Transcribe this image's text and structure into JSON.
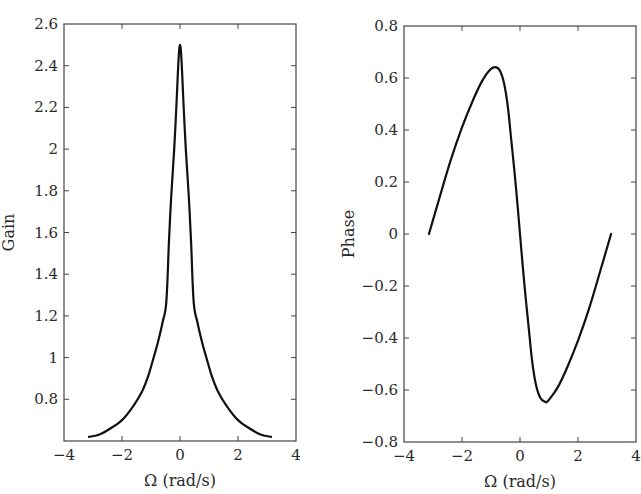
{
  "chart_data": [
    {
      "id": "gain",
      "type": "line",
      "title": "",
      "xlabel": "Ω (rad/s)",
      "ylabel": "Gain",
      "xlim": [
        -4,
        4
      ],
      "ylim": [
        0.6,
        2.6
      ],
      "xticks": [
        -4,
        -2,
        0,
        2,
        4
      ],
      "xtick_labels": [
        "−4",
        "−2",
        "0",
        "2",
        "4"
      ],
      "yticks": [
        0.8,
        1,
        1.2,
        1.4,
        1.6,
        1.8,
        2,
        2.2,
        2.4,
        2.6
      ],
      "ytick_labels": [
        "0.8",
        "1",
        "1.2",
        "1.4",
        "1.6",
        "1.8",
        "2",
        "2.2",
        "2.4",
        "2.6"
      ],
      "grid": false,
      "legend": null,
      "series": [
        {
          "name": "Gain",
          "x": [
            -3.14,
            -2.8,
            -2.4,
            -2.0,
            -1.6,
            -1.3,
            -1.1,
            -0.93,
            -0.75,
            -0.6,
            -0.47,
            -0.38,
            -0.3,
            -0.2,
            -0.12,
            -0.05,
            0,
            0.05,
            0.12,
            0.2,
            0.3,
            0.38,
            0.47,
            0.6,
            0.75,
            0.93,
            1.1,
            1.3,
            1.6,
            2.0,
            2.4,
            2.8,
            3.14
          ],
          "y": [
            0.62,
            0.63,
            0.66,
            0.7,
            0.77,
            0.84,
            0.91,
            0.99,
            1.08,
            1.17,
            1.27,
            1.56,
            1.78,
            2.0,
            2.22,
            2.43,
            2.5,
            2.43,
            2.22,
            2.0,
            1.78,
            1.56,
            1.27,
            1.17,
            1.08,
            0.99,
            0.91,
            0.84,
            0.77,
            0.7,
            0.66,
            0.63,
            0.62
          ]
        }
      ]
    },
    {
      "id": "phase",
      "type": "line",
      "title": "",
      "xlabel": "Ω (rad/s)",
      "ylabel": "Phase",
      "xlim": [
        -4,
        4
      ],
      "ylim": [
        -0.8,
        0.8
      ],
      "xticks": [
        -4,
        -2,
        0,
        2,
        4
      ],
      "xtick_labels": [
        "−4",
        "−2",
        "0",
        "2",
        "4"
      ],
      "yticks": [
        -0.8,
        -0.6,
        -0.4,
        -0.2,
        0,
        0.2,
        0.4,
        0.6,
        0.8
      ],
      "ytick_labels": [
        "−0.8",
        "−0.6",
        "−0.4",
        "−0.2",
        "0",
        "0.2",
        "0.4",
        "0.6",
        "0.8"
      ],
      "grid": false,
      "legend": null,
      "series": [
        {
          "name": "Phase",
          "x": [
            -3.14,
            -2.8,
            -2.4,
            -2.0,
            -1.6,
            -1.3,
            -1.05,
            -0.86,
            -0.7,
            -0.55,
            -0.42,
            -0.3,
            -0.2,
            -0.1,
            0,
            0.1,
            0.2,
            0.3,
            0.42,
            0.55,
            0.7,
            0.86,
            0.93,
            1.05,
            1.3,
            1.6,
            2.0,
            2.4,
            2.8,
            3.14
          ],
          "y": [
            0.0,
            0.13,
            0.28,
            0.41,
            0.52,
            0.59,
            0.63,
            0.642,
            0.63,
            0.58,
            0.49,
            0.36,
            0.25,
            0.13,
            0.0,
            -0.13,
            -0.25,
            -0.36,
            -0.49,
            -0.58,
            -0.63,
            -0.645,
            -0.646,
            -0.63,
            -0.59,
            -0.52,
            -0.41,
            -0.28,
            -0.13,
            0.0
          ]
        }
      ]
    }
  ]
}
